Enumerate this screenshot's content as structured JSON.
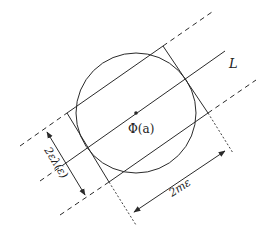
{
  "diagram": {
    "labels": {
      "line": "L",
      "center": "Φ(a)",
      "width_measure": "2ελ(ε)",
      "length_measure": "2mε"
    },
    "elements": {
      "circle": {
        "cx": 136,
        "cy": 113,
        "r": 60
      },
      "center_point": {
        "x": 136,
        "y": 113
      },
      "rectangle_corners": [
        [
          163,
          46
        ],
        [
          208,
          113
        ],
        [
          109,
          182
        ],
        [
          67,
          113
        ]
      ],
      "line_L": {
        "from": [
          66,
          163
        ],
        "to": [
          225,
          51
        ]
      }
    },
    "colors": {
      "stroke": "#2a2a2a",
      "background": "#ffffff"
    }
  }
}
